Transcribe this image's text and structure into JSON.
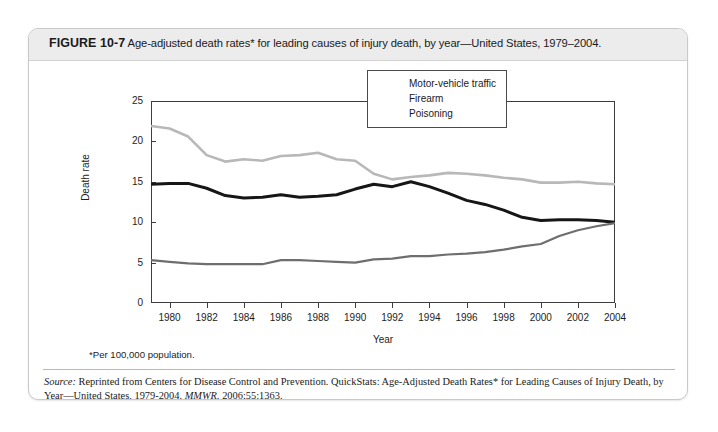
{
  "figure": {
    "number": "FIGURE 10-7",
    "caption": "Age-adjusted death rates* for leading causes of injury death, by year—United States, 1979–2004.",
    "footnote": "*Per 100,000 population.",
    "source_prefix": "Source:",
    "source_body": " Reprinted from Centers for Disease Control and Prevention. QuickStats: Age-Adjusted Death Rates* for Leading Causes of Injury Death, by Year—United States, 1979-2004. ",
    "source_journal": "MMWR.",
    "source_tail": " 2006;55:1363."
  },
  "colors": {
    "motor_vehicle": "#b8b8b8",
    "firearm": "#161616",
    "poisoning": "#6e6e6e",
    "axis": "#3d3d3d",
    "title_band": "#ececec",
    "card_border": "#c9c9c9"
  },
  "chart_data": {
    "type": "line",
    "title": "Age-adjusted death rates* for leading causes of injury death, by year—United States, 1979–2004",
    "xlabel": "Year",
    "ylabel": "Death rate",
    "xlim": [
      1979,
      2004
    ],
    "ylim": [
      0,
      25
    ],
    "yticks": [
      0,
      5,
      10,
      15,
      20,
      25
    ],
    "ytick_labels": [
      "0",
      "5",
      "10",
      "15",
      "20",
      "25"
    ],
    "xticks": [
      1980,
      1982,
      1984,
      1986,
      1988,
      1990,
      1992,
      1994,
      1996,
      1998,
      2000,
      2002,
      2004
    ],
    "xtick_labels": [
      "1980",
      "1982",
      "1984",
      "1986",
      "1988",
      "1990",
      "1992",
      "1994",
      "1996",
      "1998",
      "2000",
      "2002",
      "2004"
    ],
    "grid": false,
    "legend_position": "top-right",
    "x": [
      1979,
      1980,
      1981,
      1982,
      1983,
      1984,
      1985,
      1986,
      1987,
      1988,
      1989,
      1990,
      1991,
      1992,
      1993,
      1994,
      1995,
      1996,
      1997,
      1998,
      1999,
      2000,
      2001,
      2002,
      2003,
      2004
    ],
    "series": [
      {
        "name": "Motor-vehicle traffic",
        "color": "#b8b8b8",
        "width": 2.6,
        "values": [
          21.9,
          21.6,
          20.6,
          18.3,
          17.5,
          17.8,
          17.6,
          18.2,
          18.3,
          18.6,
          17.8,
          17.6,
          16.0,
          15.3,
          15.6,
          15.8,
          16.1,
          16.0,
          15.8,
          15.5,
          15.3,
          14.9,
          14.9,
          15.0,
          14.8,
          14.7
        ]
      },
      {
        "name": "Firearm",
        "color": "#161616",
        "width": 3.0,
        "values": [
          14.7,
          14.8,
          14.8,
          14.2,
          13.3,
          13.0,
          13.1,
          13.4,
          13.1,
          13.2,
          13.4,
          14.1,
          14.7,
          14.4,
          15.0,
          14.4,
          13.6,
          12.7,
          12.2,
          11.5,
          10.6,
          10.2,
          10.3,
          10.3,
          10.2,
          10.0
        ]
      },
      {
        "name": "Poisoning",
        "color": "#6e6e6e",
        "width": 2.2,
        "values": [
          5.3,
          5.1,
          4.9,
          4.8,
          4.8,
          4.8,
          4.8,
          5.3,
          5.3,
          5.2,
          5.1,
          5.0,
          5.4,
          5.5,
          5.8,
          5.8,
          6.0,
          6.1,
          6.3,
          6.6,
          7.0,
          7.3,
          8.3,
          9.0,
          9.5,
          9.9
        ]
      }
    ]
  },
  "legend": {
    "items": [
      {
        "label": "Motor-vehicle traffic"
      },
      {
        "label": "Firearm"
      },
      {
        "label": "Poisoning"
      }
    ]
  }
}
